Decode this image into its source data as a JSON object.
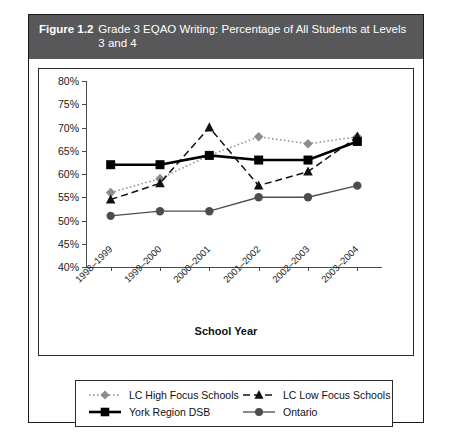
{
  "figure": {
    "number": "Figure 1.2",
    "title": "Grade 3 EQAO Writing: Percentage of All Students at Levels 3 and 4"
  },
  "colors": {
    "title_bar_bg": "#58585a",
    "title_bar_text": "#ffffff",
    "lc_high_focus": "#8c8c8c",
    "lc_low_focus": "#111111",
    "york_region_dsb": "#000000",
    "ontario": "#4d4d4d",
    "axis": "#4a4a4a",
    "border": "#1a1a1a"
  },
  "chart_data": {
    "type": "line",
    "title": "Grade 3 EQAO Writing: Percentage of All Students at Levels 3 and 4",
    "xlabel": "School Year",
    "ylabel": "",
    "categories": [
      "1998–1999",
      "1999–2000",
      "2000–2001",
      "2001–2002",
      "2002–2003",
      "2003–2004"
    ],
    "ylim": [
      40,
      80
    ],
    "ytick_labels": [
      "80%",
      "75%",
      "70%",
      "65%",
      "60%",
      "55%",
      "50%",
      "45%",
      "40%"
    ],
    "yticks": [
      80,
      75,
      70,
      65,
      60,
      55,
      50,
      45,
      40
    ],
    "grid": false,
    "legend_position": "bottom",
    "series": [
      {
        "name": "LC High Focus Schools",
        "marker": "diamond",
        "line_style": "dotted",
        "color": "#8c8c8c",
        "values": [
          56,
          59,
          64,
          68,
          66.5,
          68
        ]
      },
      {
        "name": "LC Low Focus Schools",
        "marker": "triangle",
        "line_style": "dashed",
        "color": "#111111",
        "values": [
          54.5,
          58,
          70,
          57.5,
          60.5,
          68
        ]
      },
      {
        "name": "York Region DSB",
        "marker": "square",
        "line_style": "solid",
        "color": "#000000",
        "values": [
          62,
          62,
          64,
          63,
          63,
          67
        ]
      },
      {
        "name": "Ontario",
        "marker": "circle",
        "line_style": "solid",
        "color": "#4d4d4d",
        "values": [
          51,
          52,
          52,
          55,
          55,
          57.5
        ]
      }
    ]
  }
}
